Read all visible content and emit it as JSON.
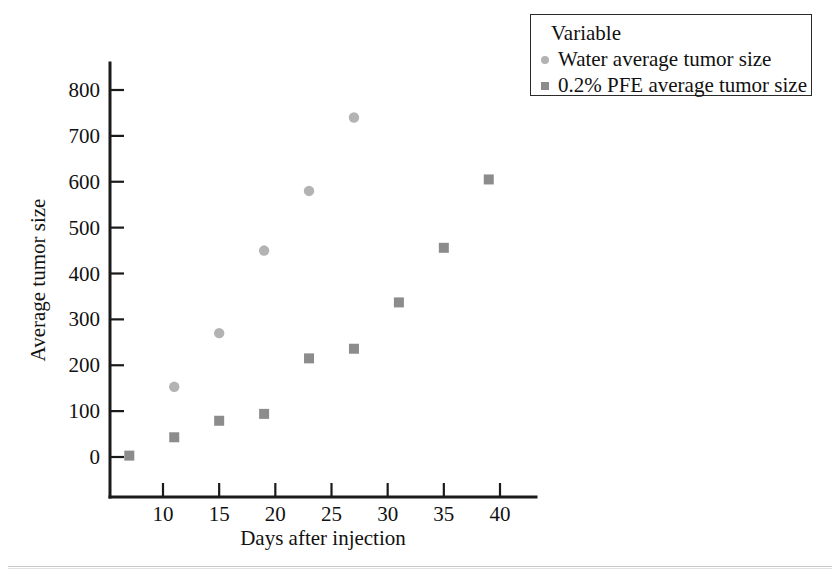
{
  "chart_data": {
    "type": "scatter",
    "title": "",
    "xlabel": "Days after injection",
    "ylabel": "Average tumor size",
    "xlim": [
      5,
      42
    ],
    "ylim": [
      -30,
      830
    ],
    "xticks": [
      10,
      15,
      20,
      25,
      30,
      35,
      40
    ],
    "yticks": [
      0,
      100,
      200,
      300,
      400,
      500,
      600,
      700,
      800
    ],
    "grid": false,
    "legend_position": "top-right",
    "legend_title": "Variable",
    "series": [
      {
        "name": "Water average tumor size",
        "marker": "circle",
        "color": "#b3b3b3",
        "x": [
          11,
          15,
          19,
          23,
          27
        ],
        "y": [
          153,
          270,
          450,
          580,
          740
        ]
      },
      {
        "name": "0.2% PFE average tumor size",
        "marker": "square",
        "color": "#8c8c8c",
        "x": [
          7,
          11,
          15,
          19,
          23,
          27,
          31,
          35,
          39
        ],
        "y": [
          3,
          43,
          79,
          94,
          215,
          236,
          337,
          456,
          605
        ]
      }
    ]
  },
  "legend": {
    "title": "Variable",
    "entries": [
      {
        "label": "Water average tumor size",
        "marker": "circle",
        "color": "#b3b3b3"
      },
      {
        "label": "0.2% PFE average tumor size",
        "marker": "square",
        "color": "#8c8c8c"
      }
    ]
  },
  "axes": {
    "x_title": "Days after injection",
    "y_title": "Average tumor size",
    "x_tick_labels": [
      "10",
      "15",
      "20",
      "25",
      "30",
      "35",
      "40"
    ],
    "y_tick_labels": [
      "0",
      "100",
      "200",
      "300",
      "400",
      "500",
      "600",
      "700",
      "800"
    ]
  },
  "colors": {
    "axis": "#1a1a1a",
    "text": "#111111",
    "series_water": "#b3b3b3",
    "series_pfe": "#8c8c8c",
    "legend_border": "#2b2b2b",
    "background": "#ffffff"
  }
}
